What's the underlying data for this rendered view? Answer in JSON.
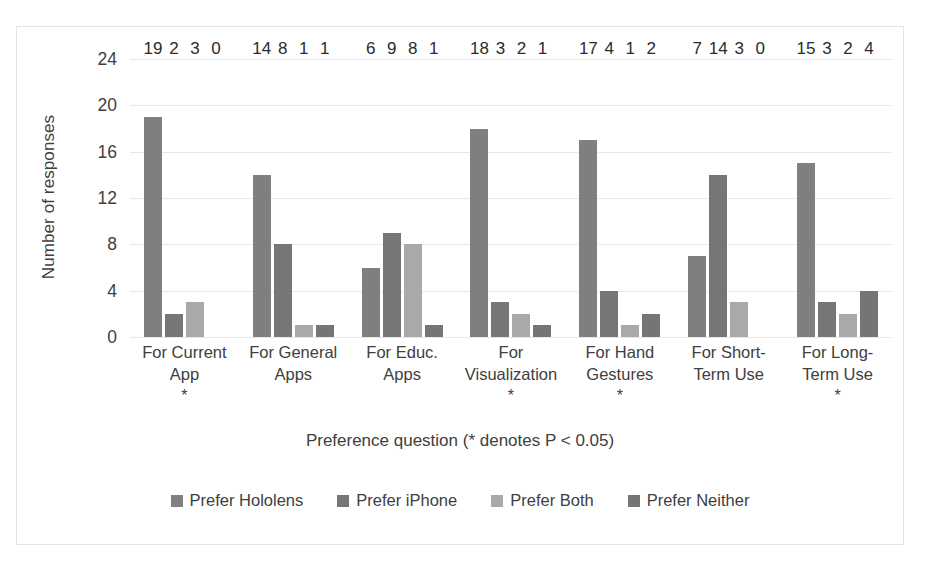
{
  "chart_data": {
    "type": "bar",
    "title": "",
    "xlabel": "Preference question (* denotes P < 0.05)",
    "ylabel": "Number of responses",
    "ylim": [
      0,
      24
    ],
    "yticks": [
      0,
      4,
      8,
      12,
      16,
      20,
      24
    ],
    "grid": true,
    "legend_position": "bottom",
    "categories": [
      "For Current App",
      "For General Apps",
      "For Educ. Apps",
      "For Visualization",
      "For Hand Gestures",
      "For Short-Term Use",
      "For Long-Term Use"
    ],
    "category_lines": [
      [
        "For Current",
        "App"
      ],
      [
        "For General",
        "Apps"
      ],
      [
        "For Educ.",
        "Apps"
      ],
      [
        "For",
        "Visualization"
      ],
      [
        "For Hand",
        "Gestures"
      ],
      [
        "For Short-",
        "Term Use"
      ],
      [
        "For Long-",
        "Term Use"
      ]
    ],
    "category_significance": [
      "*",
      "",
      "",
      "*",
      "*",
      "",
      "*"
    ],
    "series": [
      {
        "name": "Prefer Hololens",
        "color": "#7f7f7f",
        "values": [
          19,
          14,
          6,
          18,
          17,
          7,
          15
        ]
      },
      {
        "name": "Prefer iPhone",
        "color": "#767676",
        "values": [
          2,
          8,
          9,
          3,
          4,
          14,
          3
        ]
      },
      {
        "name": "Prefer Both",
        "color": "#a9a9a9",
        "values": [
          3,
          1,
          8,
          2,
          1,
          3,
          2
        ]
      },
      {
        "name": "Prefer Neither",
        "color": "#757575",
        "values": [
          0,
          1,
          1,
          1,
          2,
          0,
          4
        ]
      }
    ]
  },
  "legend": {
    "items": [
      {
        "label": "Prefer Hololens",
        "color": "#7f7f7f"
      },
      {
        "label": "Prefer iPhone",
        "color": "#767676"
      },
      {
        "label": "Prefer Both",
        "color": "#a9a9a9"
      },
      {
        "label": "Prefer Neither",
        "color": "#757575"
      }
    ]
  }
}
